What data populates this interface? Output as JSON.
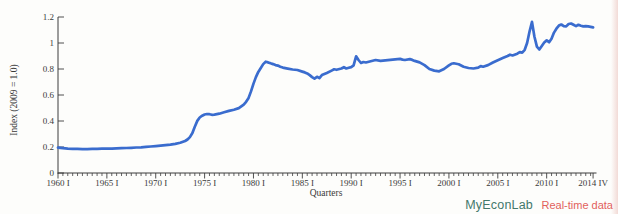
{
  "branding": {
    "product": "MyEconLab",
    "tagline": "Real-time data",
    "product_color": "#43786b",
    "tagline_color": "#e2605b"
  },
  "chart_data": {
    "type": "line",
    "title": "",
    "xlabel": "Quarters",
    "ylabel": "Index (2009 = 1.0)",
    "x_unit": "year (quarterly series, I = Q1, IV = Q4)",
    "xlim": [
      1960,
      2015.1
    ],
    "ylim": [
      0,
      1.2
    ],
    "grid": false,
    "legend": false,
    "axis_color": "#3d3d3d",
    "line_color": "#3a6cce",
    "y_ticks": [
      {
        "value": 0,
        "label": "0"
      },
      {
        "value": 0.2,
        "label": "0.2"
      },
      {
        "value": 0.4,
        "label": "0.4"
      },
      {
        "value": 0.6,
        "label": "0.6"
      },
      {
        "value": 0.8,
        "label": "0.8"
      },
      {
        "value": 1,
        "label": "1"
      },
      {
        "value": 1.2,
        "label": "1.2"
      }
    ],
    "x_ticks": [
      {
        "value": 1960,
        "label": "1960 I"
      },
      {
        "value": 1965,
        "label": "1965 I"
      },
      {
        "value": 1970,
        "label": "1970 I"
      },
      {
        "value": 1975,
        "label": "1975 I"
      },
      {
        "value": 1980,
        "label": "1980 I"
      },
      {
        "value": 1985,
        "label": "1985 I"
      },
      {
        "value": 1990,
        "label": "1990 I"
      },
      {
        "value": 1995,
        "label": "1995 I"
      },
      {
        "value": 2000,
        "label": "2000 I"
      },
      {
        "value": 2005,
        "label": "2005 I"
      },
      {
        "value": 2010,
        "label": "2010 I"
      },
      {
        "value": 2014.75,
        "label": "2014 IV"
      }
    ],
    "x_minor_tick_step": 0.5,
    "series": [
      {
        "name": "Index (2009 = 1.0)",
        "points": [
          [
            1960,
            0.195
          ],
          [
            1960.5,
            0.191
          ],
          [
            1961,
            0.188
          ],
          [
            1961.5,
            0.186
          ],
          [
            1962,
            0.185
          ],
          [
            1962.5,
            0.184
          ],
          [
            1963,
            0.184
          ],
          [
            1963.5,
            0.185
          ],
          [
            1964,
            0.186
          ],
          [
            1964.5,
            0.187
          ],
          [
            1965,
            0.187
          ],
          [
            1965.5,
            0.188
          ],
          [
            1966,
            0.19
          ],
          [
            1966.5,
            0.191
          ],
          [
            1967,
            0.192
          ],
          [
            1967.5,
            0.194
          ],
          [
            1968,
            0.196
          ],
          [
            1968.5,
            0.198
          ],
          [
            1969,
            0.201
          ],
          [
            1969.5,
            0.204
          ],
          [
            1970,
            0.207
          ],
          [
            1970.5,
            0.21
          ],
          [
            1971,
            0.214
          ],
          [
            1971.5,
            0.218
          ],
          [
            1972,
            0.224
          ],
          [
            1972.5,
            0.232
          ],
          [
            1973,
            0.246
          ],
          [
            1973.25,
            0.258
          ],
          [
            1973.5,
            0.276
          ],
          [
            1973.75,
            0.308
          ],
          [
            1974,
            0.356
          ],
          [
            1974.25,
            0.401
          ],
          [
            1974.5,
            0.427
          ],
          [
            1974.75,
            0.441
          ],
          [
            1975,
            0.45
          ],
          [
            1975.25,
            0.454
          ],
          [
            1975.5,
            0.452
          ],
          [
            1975.75,
            0.448
          ],
          [
            1976,
            0.449
          ],
          [
            1976.5,
            0.456
          ],
          [
            1977,
            0.467
          ],
          [
            1977.5,
            0.478
          ],
          [
            1978,
            0.487
          ],
          [
            1978.5,
            0.499
          ],
          [
            1979,
            0.526
          ],
          [
            1979.25,
            0.548
          ],
          [
            1979.5,
            0.578
          ],
          [
            1979.75,
            0.628
          ],
          [
            1980,
            0.688
          ],
          [
            1980.25,
            0.738
          ],
          [
            1980.5,
            0.778
          ],
          [
            1980.75,
            0.808
          ],
          [
            1981,
            0.838
          ],
          [
            1981.25,
            0.856
          ],
          [
            1981.5,
            0.851
          ],
          [
            1981.75,
            0.844
          ],
          [
            1982,
            0.838
          ],
          [
            1982.25,
            0.83
          ],
          [
            1982.5,
            0.826
          ],
          [
            1982.75,
            0.818
          ],
          [
            1983,
            0.811
          ],
          [
            1983.5,
            0.803
          ],
          [
            1984,
            0.796
          ],
          [
            1984.5,
            0.792
          ],
          [
            1985,
            0.78
          ],
          [
            1985.25,
            0.774
          ],
          [
            1985.5,
            0.766
          ],
          [
            1985.75,
            0.753
          ],
          [
            1986,
            0.738
          ],
          [
            1986.25,
            0.726
          ],
          [
            1986.5,
            0.74
          ],
          [
            1986.75,
            0.73
          ],
          [
            1987,
            0.753
          ],
          [
            1987.5,
            0.769
          ],
          [
            1988,
            0.788
          ],
          [
            1988.25,
            0.798
          ],
          [
            1988.5,
            0.794
          ],
          [
            1989,
            0.804
          ],
          [
            1989.25,
            0.814
          ],
          [
            1989.5,
            0.804
          ],
          [
            1989.75,
            0.809
          ],
          [
            1990,
            0.815
          ],
          [
            1990.25,
            0.828
          ],
          [
            1990.5,
            0.898
          ],
          [
            1990.75,
            0.869
          ],
          [
            1991,
            0.846
          ],
          [
            1991.25,
            0.854
          ],
          [
            1991.5,
            0.85
          ],
          [
            1992,
            0.859
          ],
          [
            1992.5,
            0.869
          ],
          [
            1993,
            0.862
          ],
          [
            1993.5,
            0.866
          ],
          [
            1994,
            0.87
          ],
          [
            1994.5,
            0.874
          ],
          [
            1995,
            0.878
          ],
          [
            1995.25,
            0.872
          ],
          [
            1995.5,
            0.869
          ],
          [
            1996,
            0.876
          ],
          [
            1996.25,
            0.87
          ],
          [
            1996.5,
            0.862
          ],
          [
            1997,
            0.851
          ],
          [
            1997.5,
            0.83
          ],
          [
            1998,
            0.8
          ],
          [
            1998.5,
            0.788
          ],
          [
            1999,
            0.782
          ],
          [
            1999.5,
            0.8
          ],
          [
            2000,
            0.828
          ],
          [
            2000.25,
            0.84
          ],
          [
            2000.5,
            0.844
          ],
          [
            2001,
            0.836
          ],
          [
            2001.5,
            0.818
          ],
          [
            2002,
            0.808
          ],
          [
            2002.5,
            0.804
          ],
          [
            2003,
            0.81
          ],
          [
            2003.25,
            0.822
          ],
          [
            2003.5,
            0.818
          ],
          [
            2004,
            0.83
          ],
          [
            2004.5,
            0.85
          ],
          [
            2005,
            0.868
          ],
          [
            2005.5,
            0.884
          ],
          [
            2006,
            0.9
          ],
          [
            2006.25,
            0.91
          ],
          [
            2006.5,
            0.904
          ],
          [
            2007,
            0.918
          ],
          [
            2007.25,
            0.93
          ],
          [
            2007.5,
            0.926
          ],
          [
            2007.75,
            0.948
          ],
          [
            2008,
            1.0
          ],
          [
            2008.25,
            1.09
          ],
          [
            2008.5,
            1.162
          ],
          [
            2008.75,
            1.05
          ],
          [
            2009,
            0.972
          ],
          [
            2009.25,
            0.95
          ],
          [
            2009.5,
            0.978
          ],
          [
            2009.75,
            1.004
          ],
          [
            2010,
            1.02
          ],
          [
            2010.25,
            1.006
          ],
          [
            2010.5,
            1.032
          ],
          [
            2010.75,
            1.08
          ],
          [
            2011,
            1.11
          ],
          [
            2011.25,
            1.134
          ],
          [
            2011.5,
            1.142
          ],
          [
            2011.75,
            1.13
          ],
          [
            2012,
            1.128
          ],
          [
            2012.25,
            1.146
          ],
          [
            2012.5,
            1.15
          ],
          [
            2012.75,
            1.14
          ],
          [
            2013,
            1.13
          ],
          [
            2013.25,
            1.14
          ],
          [
            2013.5,
            1.132
          ],
          [
            2013.75,
            1.128
          ],
          [
            2014,
            1.13
          ],
          [
            2014.25,
            1.128
          ],
          [
            2014.5,
            1.124
          ],
          [
            2014.75,
            1.12
          ]
        ]
      }
    ]
  }
}
